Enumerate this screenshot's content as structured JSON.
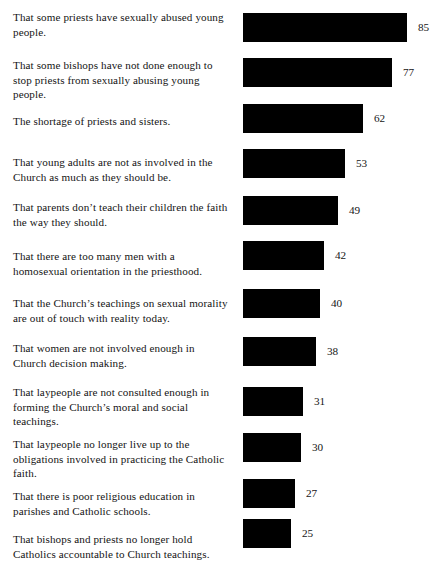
{
  "chart_data": {
    "type": "bar",
    "title": "",
    "subtitle": "",
    "xlabel": "",
    "ylabel": "",
    "orientation": "horizontal",
    "grid": false,
    "legend": null,
    "axis_visible": false,
    "value_labels": true,
    "xlim": [
      0,
      100
    ],
    "bar_color": "#000000",
    "background_color": "#ffffff",
    "categories": [
      "That some priests have sexually abused young people.",
      "That some bishops have not done enough to stop priests from sexually abusing young people.",
      "The shortage of priests and sisters.",
      "That young adults are not as involved in the Church as much as they should be.",
      "That parents don’t teach their children the faith the way they should.",
      "That there are too many men with a homosexual orientation in the priesthood.",
      "That the Church’s teachings on sexual morality are out of touch with reality today.",
      "That women are not involved enough in Church decision making.",
      "That laypeople are not consulted enough in forming the Church’s moral and social teachings.",
      "That laypeople no longer live up to the obligations involved in practicing the Catholic faith.",
      "That there is poor religious education in parishes and Catholic schools.",
      "That bishops and priests no longer hold Catholics accountable to Church teachings."
    ],
    "values": [
      85,
      77,
      62,
      53,
      49,
      42,
      40,
      38,
      31,
      30,
      27,
      25
    ]
  },
  "rows": [
    {
      "label": "That some priests have sexually abused young\npeople.",
      "value": 85,
      "value_text": "85",
      "label_top": 10,
      "bar_top": 13
    },
    {
      "label": "That some bishops have not done enough to\nstop priests from sexually abusing young\npeople.",
      "value": 77,
      "value_text": "77",
      "label_top": 58,
      "bar_top": 58
    },
    {
      "label": "The shortage of priests and sisters.",
      "value": 62,
      "value_text": "62",
      "label_top": 114,
      "bar_top": 104
    },
    {
      "label": "That young adults are not as involved in the\nChurch as much as they should be.",
      "value": 53,
      "value_text": "53",
      "label_top": 155,
      "bar_top": 149
    },
    {
      "label": "That parents don’t teach their children the faith\nthe way they should.",
      "value": 49,
      "value_text": "49",
      "label_top": 200,
      "bar_top": 196
    },
    {
      "label": "That there are too many men with a\nhomosexual orientation in the priesthood.",
      "value": 42,
      "value_text": "42",
      "label_top": 249,
      "bar_top": 241
    },
    {
      "label": "That the Church’s teachings on sexual morality\nare out of touch with reality today.",
      "value": 40,
      "value_text": "40",
      "label_top": 296,
      "bar_top": 289
    },
    {
      "label": "That women are not involved enough in\nChurch decision making.",
      "value": 38,
      "value_text": "38",
      "label_top": 341,
      "bar_top": 337
    },
    {
      "label": "That laypeople are not consulted enough in\nforming the Church’s moral and social\nteachings.",
      "value": 31,
      "value_text": "31",
      "label_top": 385,
      "bar_top": 387
    },
    {
      "label": "That laypeople no longer live up to the\nobligations involved in practicing the Catholic\nfaith.",
      "value": 30,
      "value_text": "30",
      "label_top": 437,
      "bar_top": 433
    },
    {
      "label": "That there is poor religious education in\nparishes and Catholic schools.",
      "value": 27,
      "value_text": "27",
      "label_top": 489,
      "bar_top": 479
    },
    {
      "label": "That bishops and priests no longer hold\nCatholics accountable to Church teachings.",
      "value": 25,
      "value_text": "25",
      "label_top": 532,
      "bar_top": 519
    }
  ],
  "scale": {
    "px_per_unit": 1.93,
    "bar_origin_x": 243,
    "bar_height": 29
  }
}
